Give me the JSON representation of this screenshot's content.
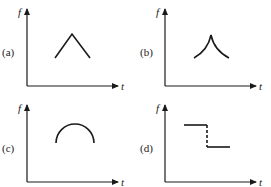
{
  "panels": [
    {
      "label": "(a)",
      "y_axis": "f",
      "x_axis": "t",
      "shape": "triangle-peak"
    },
    {
      "label": "(b)",
      "y_axis": "f",
      "x_axis": "t",
      "shape": "cusp-peak"
    },
    {
      "label": "(c)",
      "y_axis": "f",
      "x_axis": "t",
      "shape": "semicircle-arc"
    },
    {
      "label": "(d)",
      "y_axis": "f",
      "x_axis": "t",
      "shape": "step-down-discontinuity"
    }
  ],
  "colors": {
    "ink": "#1a1a1a",
    "background": "#ffffff"
  }
}
